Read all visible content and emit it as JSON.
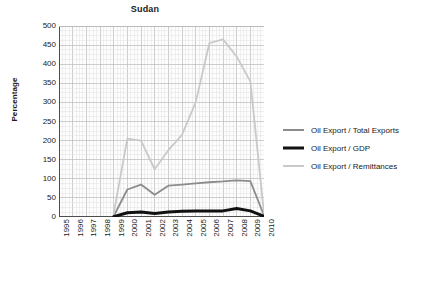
{
  "chart_data": {
    "type": "line",
    "title": "Sudan",
    "xlabel": "",
    "ylabel": "Percentage",
    "xlim": [
      1995,
      2010
    ],
    "ylim": [
      0,
      500
    ],
    "ytick_step": 50,
    "grid": true,
    "minor_grid": true,
    "legend_position": "right",
    "categories": [
      1995,
      1996,
      1997,
      1998,
      1999,
      2000,
      2001,
      2002,
      2003,
      2004,
      2005,
      2006,
      2007,
      2008,
      2009,
      2010
    ],
    "x": [
      "1995",
      "1996",
      "1997",
      "1998",
      "1999",
      "2000",
      "2001",
      "2002",
      "2003",
      "2004",
      "2005",
      "2006",
      "2007",
      "2008",
      "2009",
      "2010"
    ],
    "yticks": [
      "0",
      "50",
      "100",
      "150",
      "200",
      "250",
      "300",
      "350",
      "400",
      "450",
      "500"
    ],
    "series": [
      {
        "name": "Oil Export / Total Exports",
        "color": "#8c8c8c",
        "width": 1.8,
        "values": [
          null,
          null,
          null,
          null,
          2,
          72,
          85,
          58,
          82,
          85,
          88,
          91,
          93,
          96,
          94,
          4
        ]
      },
      {
        "name": "Oil Export / GDP",
        "color": "#111111",
        "width": 3.0,
        "values": [
          null,
          null,
          null,
          null,
          1,
          11,
          13,
          9,
          13,
          15,
          16,
          16,
          16,
          22,
          16,
          2
        ]
      },
      {
        "name": "Oil Export / Remittances",
        "color": "#c9c9c9",
        "width": 1.8,
        "values": [
          null,
          null,
          null,
          null,
          8,
          205,
          200,
          125,
          175,
          215,
          300,
          455,
          465,
          420,
          355,
          10
        ]
      }
    ]
  },
  "legend": {
    "items": [
      {
        "label": "Oil Export / Total Exports",
        "color": "#8c8c8c",
        "thickness": "2px"
      },
      {
        "label": "Oil Export / GDP",
        "color": "#111111",
        "thickness": "3px"
      },
      {
        "label": "Oil Export / Remittances",
        "color": "#c9c9c9",
        "thickness": "2px"
      }
    ]
  },
  "colors": {
    "axis": "#4d4d4d",
    "grid_major": "#b9b9b9",
    "grid_minor": "#e2e2e2",
    "text": "#1a1a1a",
    "background": "#ffffff"
  }
}
